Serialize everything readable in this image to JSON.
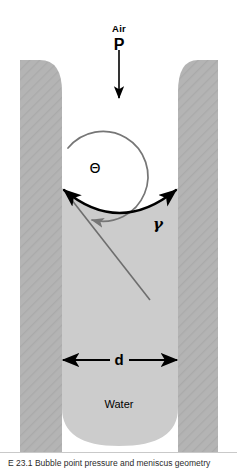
{
  "figure": {
    "labels": {
      "air": "Air",
      "pressure": "P",
      "contact_angle": "Θ",
      "surface_tension": "γ",
      "diameter": "d",
      "liquid": "Water"
    },
    "caption": "E 23.1   Bubble point pressure and meniscus geometry",
    "colors": {
      "wall_fill": "#b4b4b4",
      "wall_hatch": "#a8a8a8",
      "water_fill": "#cccccc",
      "meniscus_line": "#000000",
      "angle_arc": "#767676",
      "normal_line": "#6e6e6e",
      "background": "#ffffff",
      "text": "#000000"
    },
    "geometry": {
      "gap_left_x": 62,
      "gap_right_x": 178,
      "gap_width_d": 116,
      "wall_left_outer_x": 20,
      "wall_right_outer_x": 218,
      "wall_top_y": 60,
      "wall_bottom_y": 452,
      "meniscus_center_y": 212,
      "contact_point_y": 188,
      "water_bottom_y": 446,
      "pressure_arrow_x": 119,
      "pressure_arrow_y_top": 50,
      "pressure_arrow_y_bottom": 100,
      "dimension_arrow_y": 360,
      "angle_arc_center_x": 118,
      "angle_arc_center_y": 178,
      "angle_arc_radius": 45
    },
    "label_positions": {
      "air": [
        119,
        29
      ],
      "pressure": [
        119,
        45
      ],
      "contact_angle": [
        95,
        168
      ],
      "surface_tension": [
        158,
        224
      ],
      "diameter": [
        119,
        359
      ],
      "liquid": [
        119,
        404
      ]
    }
  }
}
